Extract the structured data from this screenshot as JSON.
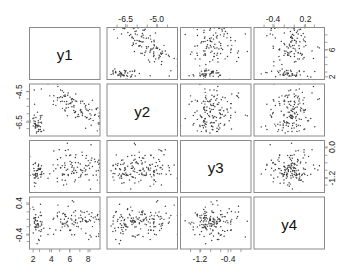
{
  "figure": {
    "type": "scatterplot-matrix",
    "title": "",
    "variables": [
      "y1",
      "y2",
      "y3",
      "y4"
    ],
    "n_points": 150,
    "point_color": "#3a3a3a",
    "frame_color": "#8a8a8a",
    "background": "#ffffff"
  },
  "axes": {
    "top": [
      {
        "column": 1,
        "variable": "y1",
        "ticks": [],
        "labels": []
      },
      {
        "column": 2,
        "variable": "y2",
        "ticks": [
          -6.5,
          -5.0
        ],
        "labels": [
          "-6.5",
          "-5.0"
        ]
      },
      {
        "column": 3,
        "variable": "y3",
        "ticks": [],
        "labels": []
      },
      {
        "column": 4,
        "variable": "y4",
        "ticks": [
          -0.4,
          0.2
        ],
        "labels": [
          "-0.4",
          "0.2"
        ]
      }
    ],
    "bottom": [
      {
        "column": 1,
        "variable": "y1",
        "ticks": [
          2,
          4,
          6,
          8
        ],
        "labels": [
          "2",
          "4",
          "6",
          "8"
        ]
      },
      {
        "column": 2,
        "variable": "y2",
        "ticks": [],
        "labels": []
      },
      {
        "column": 3,
        "variable": "y3",
        "ticks": [
          -1.2,
          -0.4
        ],
        "labels": [
          "-1.2",
          "-0.4"
        ]
      },
      {
        "column": 4,
        "variable": "y4",
        "ticks": [],
        "labels": []
      }
    ],
    "left": [
      {
        "row": 1,
        "variable": "y1",
        "ticks": [],
        "labels": []
      },
      {
        "row": 2,
        "variable": "y2",
        "ticks": [
          -4.5,
          -6.5
        ],
        "labels": [
          "-4.5",
          "-6.5"
        ]
      },
      {
        "row": 3,
        "variable": "y3",
        "ticks": [],
        "labels": []
      },
      {
        "row": 4,
        "variable": "y4",
        "ticks": [
          0.4,
          -0.4
        ],
        "labels": [
          "0.4",
          "-0.4"
        ]
      }
    ],
    "right": [
      {
        "row": 1,
        "variable": "y1",
        "ticks": [
          6,
          2
        ],
        "labels": [
          "6",
          "2"
        ]
      },
      {
        "row": 2,
        "variable": "y2",
        "ticks": [],
        "labels": []
      },
      {
        "row": 3,
        "variable": "y3",
        "ticks": [
          0.0,
          -1.2
        ],
        "labels": [
          "0.0",
          "-1.2"
        ]
      },
      {
        "row": 4,
        "variable": "y4",
        "ticks": [],
        "labels": []
      }
    ]
  },
  "diagonal_labels": [
    "y1",
    "y2",
    "y3",
    "y4"
  ],
  "chart_data": {
    "type": "scatter",
    "title": "",
    "xlabel": "",
    "ylabel": "",
    "variables": [
      "y1",
      "y2",
      "y3",
      "y4"
    ],
    "ranges": {
      "y1": [
        1.6,
        9.3
      ],
      "y2": [
        -7.4,
        -4.0
      ],
      "y3": [
        -1.75,
        0.25
      ],
      "y4": [
        -0.75,
        0.55
      ]
    },
    "series": [
      {
        "name": "cluster-A",
        "count": 105,
        "center": {
          "y1": 6.5,
          "y2": -5.4,
          "y3": -0.75,
          "y4": -0.05
        },
        "spread": {
          "y1": 1.5,
          "y2": 0.65,
          "y3": 0.32,
          "y4": 0.2
        },
        "correlation_y1_y2": -0.82
      },
      {
        "name": "cluster-B",
        "count": 45,
        "center": {
          "y1": 2.5,
          "y2": -6.6,
          "y3": -0.95,
          "y4": -0.1
        },
        "spread": {
          "y1": 0.33,
          "y2": 0.42,
          "y3": 0.3,
          "y4": 0.2
        },
        "correlation_y1_y2": -0.2
      }
    ]
  }
}
